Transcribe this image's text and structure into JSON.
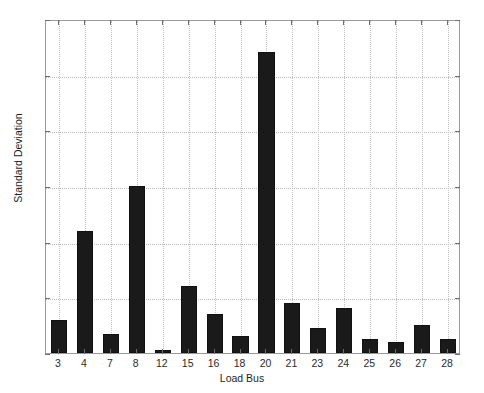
{
  "chart_data": {
    "type": "bar",
    "title": "",
    "xlabel": "Load Bus",
    "ylabel": "Standard Deviation",
    "categories": [
      "3",
      "4",
      "7",
      "8",
      "12",
      "15",
      "16",
      "18",
      "20",
      "21",
      "23",
      "24",
      "25",
      "26",
      "27",
      "28"
    ],
    "values": [
      0.6,
      2.2,
      0.34,
      3.0,
      0.05,
      1.2,
      0.7,
      0.3,
      5.4,
      0.9,
      0.45,
      0.8,
      0.25,
      0.2,
      0.5,
      0.25
    ],
    "series": [
      {
        "name": "Standard Deviation",
        "values": [
          0.6,
          2.2,
          0.34,
          3.0,
          0.05,
          1.2,
          0.7,
          0.3,
          5.4,
          0.9,
          0.45,
          0.8,
          0.25,
          0.2,
          0.5,
          0.25
        ]
      }
    ],
    "ylim": [
      0,
      6
    ],
    "yticks": [
      0,
      1,
      2,
      3,
      4,
      5,
      6
    ],
    "ytick_labels": [
      "0",
      "1",
      "2",
      "3",
      "4",
      "5",
      "6"
    ],
    "grid": true,
    "grid_style": "dotted",
    "legend": false,
    "legend_position": "none",
    "bar_color": "#1a1a1a",
    "grid_color": "#b9b9b9",
    "axis_color": "#9a9a9a",
    "background_color": "#ffffff",
    "bar_width_fraction": 0.62
  }
}
